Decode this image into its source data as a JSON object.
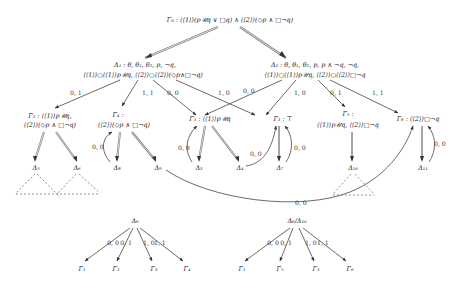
{
  "diagram": {
    "root": {
      "id": "G0",
      "text": "Γ₀ : ⟨⟨1⟩⟩(p𝒰q ∨ □q) ∧ ⟨⟨2⟩⟩(◇p ∧ □¬q)"
    },
    "level1": [
      {
        "id": "D1",
        "line1": "Δ₁ : θ, θ₁, θ₂, p, ¬q,",
        "line2": "⟨⟨1⟩⟩○⟨⟨1⟩⟩p𝒰q, ⟨⟨2⟩⟩○⟨⟨2⟩⟩(◇p∧□¬q)"
      },
      {
        "id": "D2",
        "line1": "Δ₂ : θ, θ₁, θ₂, p, p ∧ ¬q, ¬q,",
        "line2": "⟨⟨1⟩⟩○⟨⟨1⟩⟩p𝒰q, ⟨⟨2⟩⟩○⟨⟨2⟩⟩□¬q"
      }
    ],
    "level2": [
      {
        "id": "G2",
        "line1": "Γ₂ : ⟨⟨1⟩⟩p𝒰q,",
        "line2": "⟨⟨2⟩⟩(◇p ∧ □¬q)"
      },
      {
        "id": "G4",
        "line1": "Γ₄ :",
        "line2": "⟨⟨2⟩⟩(◇p ∧ □¬q)"
      },
      {
        "id": "G1",
        "line1": "Γ₁ : ⟨⟨1⟩⟩p𝒰q",
        "line2": ""
      },
      {
        "id": "G3",
        "line1": "Γ₃ : ⊤",
        "line2": ""
      },
      {
        "id": "G5",
        "line1": "Γ₅ :",
        "line2": "⟨⟨1⟩⟩p𝒰q, ⟨⟨2⟩⟩□¬q"
      },
      {
        "id": "G6",
        "line1": "Γ₆ : ⟨⟨2⟩⟩□¬q",
        "line2": ""
      }
    ],
    "level3": [
      {
        "id": "D5",
        "text": "Δ₅"
      },
      {
        "id": "D6",
        "text": "Δ₆"
      },
      {
        "id": "D8",
        "text": "Δ₈"
      },
      {
        "id": "D9",
        "text": "Δ₉"
      },
      {
        "id": "D3",
        "text": "Δ₃"
      },
      {
        "id": "D4",
        "text": "Δ₄"
      },
      {
        "id": "D7",
        "text": "Δ₇"
      },
      {
        "id": "D10",
        "text": "Δ₁₀"
      },
      {
        "id": "D11",
        "text": "Δ₁₁"
      }
    ],
    "edge_labels": {
      "d1_g2": "0, 1",
      "d1_g4": "1, 1",
      "d1_g1": "0, 0",
      "d1_g3": "1, 0",
      "d2_g1": "0, 0",
      "d2_g3": "1, 0",
      "d2_g5": "0, 1",
      "d2_g6": "1, 1",
      "d8_g4": "0, 0",
      "d3_g1": "0, 0",
      "d4_g3": "0, 0",
      "d7_g3": "0, 0",
      "d11_g6": "0, 0",
      "d9_g6": "0, 0"
    },
    "bottom_left": {
      "root": "Δ₆",
      "edges": [
        "0, 0",
        "0, 1",
        "1, 0",
        "1, 1"
      ],
      "leaves": [
        "Γ₁",
        "Γ₂",
        "Γ₃",
        "Γ₄"
      ]
    },
    "bottom_right": {
      "root": "Δ₆/Δ₁₀",
      "edges": [
        "0, 0",
        "0, 1",
        "1, 0",
        "1, 1"
      ],
      "leaves": [
        "Γ₁",
        "Γ₅",
        "Γ₃",
        "Γ₆"
      ]
    },
    "colors": {
      "edge": "#555555",
      "double_edge": "#777777",
      "dashed": "#666666",
      "text": "#222222"
    }
  }
}
